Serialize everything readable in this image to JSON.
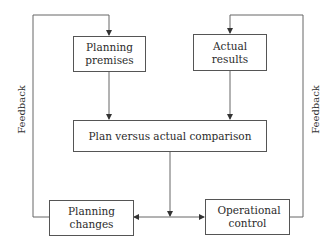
{
  "diagram": {
    "nodes": {
      "planning_premises": "Planning premises",
      "actual_results": "Actual results",
      "comparison": "Plan versus actual comparison",
      "planning_changes": "Planning changes",
      "operational_control": "Operational control"
    },
    "labels": {
      "feedback_left": "Feedback",
      "feedback_right": "Feedback"
    },
    "edges": [
      {
        "from": "planning_premises",
        "to": "comparison"
      },
      {
        "from": "actual_results",
        "to": "comparison"
      },
      {
        "from": "comparison",
        "to": "planning_changes"
      },
      {
        "from": "comparison",
        "to": "operational_control"
      },
      {
        "from": "planning_changes",
        "to": "planning_premises",
        "label": "Feedback"
      },
      {
        "from": "operational_control",
        "to": "actual_results",
        "label": "Feedback"
      }
    ],
    "colors": {
      "line": "#555555",
      "text": "#2b2b2b",
      "background": "#ffffff"
    }
  }
}
